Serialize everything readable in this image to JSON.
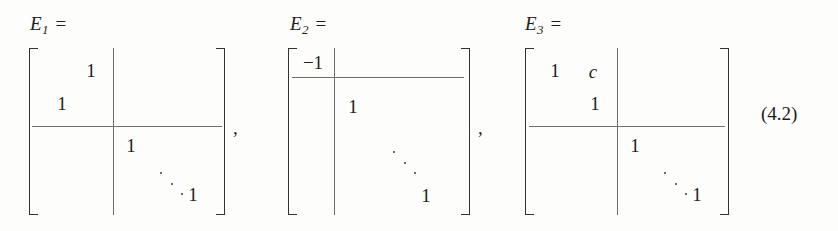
{
  "equation": {
    "number": "(4.2)",
    "separator": ",",
    "matrices": [
      {
        "label_base": "E",
        "label_sub": "1",
        "label_eq": "=",
        "partition": {
          "row_split": 2,
          "col_split": 2
        },
        "entries": [
          {
            "value": "1",
            "row": 1,
            "col": 2,
            "italic": false
          },
          {
            "value": "1",
            "row": 2,
            "col": 1,
            "italic": false
          },
          {
            "value": "1",
            "row": 3,
            "col": 3,
            "italic": false
          },
          {
            "value": "1",
            "row": 5,
            "col": 5,
            "italic": false
          }
        ],
        "dots": "⋱",
        "trailing_separator": ","
      },
      {
        "label_base": "E",
        "label_sub": "2",
        "label_eq": "=",
        "partition": {
          "row_split": 1,
          "col_split": 1
        },
        "entries": [
          {
            "value": "−1",
            "row": 1,
            "col": 1,
            "italic": false
          },
          {
            "value": "1",
            "row": 2,
            "col": 2,
            "italic": false
          },
          {
            "value": "1",
            "row": 5,
            "col": 5,
            "italic": false
          }
        ],
        "dots": "⋱",
        "trailing_separator": ","
      },
      {
        "label_base": "E",
        "label_sub": "3",
        "label_eq": "=",
        "partition": {
          "row_split": 2,
          "col_split": 2
        },
        "entries": [
          {
            "value": "1",
            "row": 1,
            "col": 1,
            "italic": false
          },
          {
            "value": "c",
            "row": 1,
            "col": 2,
            "italic": true
          },
          {
            "value": "1",
            "row": 2,
            "col": 2,
            "italic": false
          },
          {
            "value": "1",
            "row": 3,
            "col": 3,
            "italic": false
          },
          {
            "value": "1",
            "row": 5,
            "col": 5,
            "italic": false
          }
        ],
        "dots": "⋱",
        "trailing_separator": ""
      }
    ]
  },
  "colors": {
    "background": "#fdfdfc",
    "text": "#1d1d1d",
    "bracket": "#333333",
    "rule": "#6f6f6f",
    "dot": "#3a3a3a"
  }
}
